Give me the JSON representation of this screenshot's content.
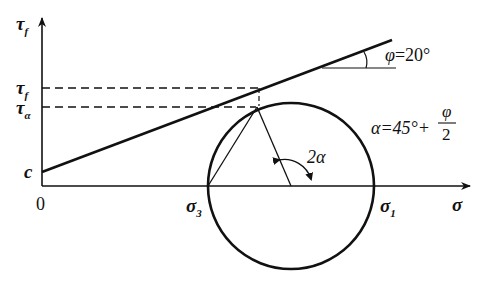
{
  "figure": {
    "type": "mohr-coulomb-diagram",
    "axes": {
      "y_label": "τ",
      "y_label_sub": "f",
      "x_label": "σ",
      "origin_label": "0"
    },
    "y_ticks": [
      {
        "symbol": "τ",
        "sub": "f"
      },
      {
        "symbol": "τ",
        "sub": "α"
      },
      {
        "symbol": "c",
        "sub": ""
      }
    ],
    "x_ticks": [
      {
        "symbol": "σ",
        "sub": "3"
      },
      {
        "symbol": "σ",
        "sub": "1"
      }
    ],
    "annotations": {
      "friction_angle": "φ=20°",
      "phi_symbol": "φ",
      "phi_value": "=20°",
      "alpha_formula_left": "α=45°+",
      "alpha_frac_num": "φ",
      "alpha_frac_den": "2",
      "double_angle": "2α"
    },
    "colors": {
      "stroke": "#111111",
      "background": "#ffffff"
    }
  }
}
